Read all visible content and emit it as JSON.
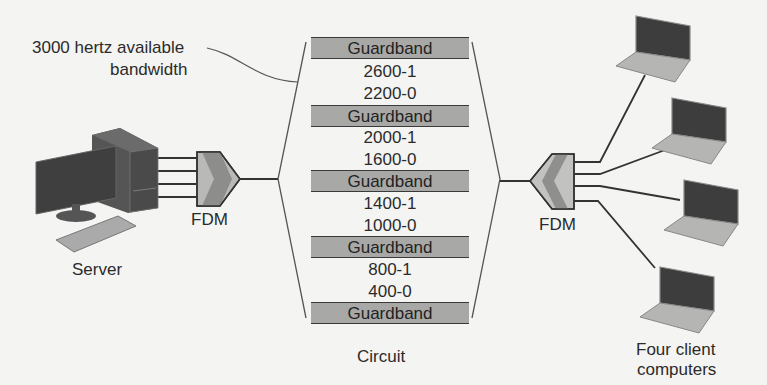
{
  "annotation": {
    "line1": "3000 hertz available",
    "line2": "bandwidth"
  },
  "server": {
    "label": "Server"
  },
  "fdm_left": {
    "label": "FDM"
  },
  "fdm_right": {
    "label": "FDM"
  },
  "circuit": {
    "label": "Circuit",
    "guardband_label": "Guardband",
    "rows": [
      {
        "type": "guardband",
        "label": "Guardband"
      },
      {
        "type": "freq",
        "label": "2600-1"
      },
      {
        "type": "freq",
        "label": "2200-0"
      },
      {
        "type": "guardband",
        "label": "Guardband"
      },
      {
        "type": "freq",
        "label": "2000-1"
      },
      {
        "type": "freq",
        "label": "1600-0"
      },
      {
        "type": "guardband",
        "label": "Guardband"
      },
      {
        "type": "freq",
        "label": "1400-1"
      },
      {
        "type": "freq",
        "label": "1000-0"
      },
      {
        "type": "guardband",
        "label": "Guardband"
      },
      {
        "type": "freq",
        "label": "800-1"
      },
      {
        "type": "freq",
        "label": "400-0"
      },
      {
        "type": "guardband",
        "label": "Guardband"
      }
    ]
  },
  "clients": {
    "label_line1": "Four client",
    "label_line2": "computers",
    "count": 4
  },
  "colors": {
    "background": "#f4f4f2",
    "guardband_fill": "#a8a8a6",
    "line": "#333333",
    "device_dark": "#444444",
    "device_light": "#b8b8b6"
  }
}
